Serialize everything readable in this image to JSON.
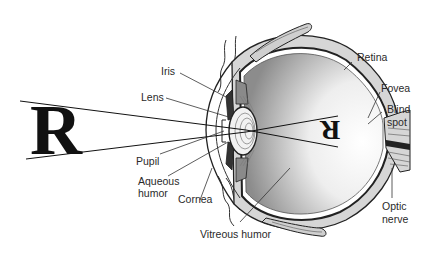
{
  "diagram": {
    "object_letter": "R",
    "image_letter": "R",
    "labels": {
      "iris": "Iris",
      "lens": "Lens",
      "pupil": "Pupil",
      "aqueous_1": "Aqueous",
      "aqueous_2": "humor",
      "cornea": "Cornea",
      "vitreous": "Vitreous humor",
      "retina": "Retina",
      "fovea": "Fovea",
      "blind_1": "Blind",
      "blind_2": "spot",
      "optic_1": "Optic",
      "optic_2": "nerve"
    },
    "colors": {
      "line": "#222222",
      "sclera_fill": "#d9d9d9",
      "shade_dark": "#9a9a9a",
      "background": "#ffffff"
    }
  }
}
